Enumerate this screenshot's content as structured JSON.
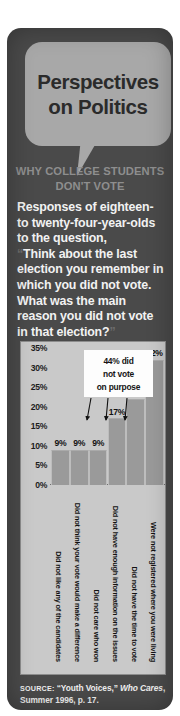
{
  "header": {
    "title_line1": "Perspectives",
    "title_line2": "on Politics",
    "subtitle_line1": "WHY COLLEGE STUDENTS",
    "subtitle_line2": "DON'T VOTE"
  },
  "body": {
    "intro": "Responses of eighteen- to twenty-four-year-olds to the question,",
    "quote_open": "“",
    "quote_text": "Think about the last election you remember in which you did not vote. What was the main reason you did not vote in that election?",
    "quote_close": "”"
  },
  "callout": {
    "line1": "44% did",
    "line2": "not vote",
    "line3": "on purpose"
  },
  "source": {
    "label": "SOURCE:",
    "quoted": "“Youth Voices,”",
    "italic": "Who Cares",
    "rest": ", Summer 1996, p. 17."
  },
  "colors": {
    "panel": "#4a4a4a",
    "bubble": "#a8a8a8",
    "chart_bg": "#c9c9c9",
    "bar": "#9a9a9a",
    "callout_bg": "#fdfdfd",
    "subtitle": "#8e8e8e",
    "body_text": "#f2f2f2"
  },
  "chart_data": {
    "type": "bar",
    "title": "",
    "xlabel": "",
    "ylabel": "",
    "ylim": [
      0,
      35
    ],
    "grid": false,
    "legend": "none",
    "ytick_labels": [
      "35%",
      "30%",
      "25%",
      "20%",
      "15%",
      "10%",
      "5%",
      "0%"
    ],
    "ytick_values": [
      35,
      30,
      25,
      20,
      15,
      10,
      5,
      0
    ],
    "categories": [
      "Did not like any of the candidates",
      "Did not think your vote would make a difference",
      "Did not care who won",
      "Did not have enough information on the issues",
      "Did not have the time to vote",
      "Were not registered where you were living"
    ],
    "values": [
      9,
      9,
      9,
      17,
      22,
      32
    ],
    "value_labels": [
      "9%",
      "9%",
      "9%",
      "17%",
      "22%",
      "32%"
    ],
    "annotations": [
      {
        "text": "44% did not vote on purpose",
        "points_to": [
          "Did not like any of the candidates",
          "Did not think your vote would make a difference",
          "Did not care who won",
          "Did not have enough information on the issues"
        ]
      }
    ]
  }
}
